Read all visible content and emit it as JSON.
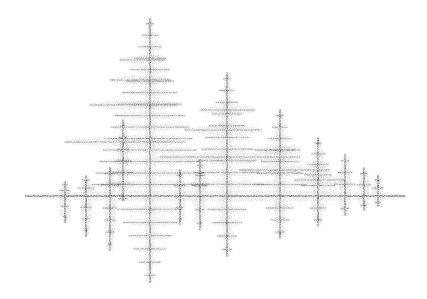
{
  "image": {
    "description": "Grayscale fractal of fir trees mirrored along a horizontal axis (IFS fern-like pattern)",
    "background": "#ffffff",
    "ink": "#2a2a2a"
  },
  "axis": {
    "x1": 25,
    "x2": 405,
    "y": 196
  },
  "trees": [
    {
      "x": 150,
      "top": 18,
      "bottom": 282,
      "halfwidth": 62
    },
    {
      "x": 227,
      "top": 73,
      "bottom": 256,
      "halfwidth": 40
    },
    {
      "x": 280,
      "top": 110,
      "bottom": 238,
      "halfwidth": 30
    },
    {
      "x": 318,
      "top": 138,
      "bottom": 226,
      "halfwidth": 20
    },
    {
      "x": 345,
      "top": 155,
      "bottom": 215,
      "halfwidth": 14
    },
    {
      "x": 364,
      "top": 168,
      "bottom": 210,
      "halfwidth": 10
    },
    {
      "x": 378,
      "top": 176,
      "bottom": 206,
      "halfwidth": 8
    },
    {
      "x": 86,
      "top": 176,
      "bottom": 236,
      "halfwidth": 12
    },
    {
      "x": 110,
      "top": 168,
      "bottom": 250,
      "halfwidth": 14
    },
    {
      "x": 65,
      "top": 182,
      "bottom": 222,
      "halfwidth": 8
    },
    {
      "x": 123,
      "top": 120,
      "bottom": 200,
      "halfwidth": 14
    },
    {
      "x": 200,
      "top": 160,
      "bottom": 230,
      "halfwidth": 10
    },
    {
      "x": 180,
      "top": 170,
      "bottom": 225,
      "halfwidth": 8
    }
  ],
  "branches": [
    {
      "x1": 65,
      "x2": 185,
      "y": 142
    },
    {
      "x1": 90,
      "x2": 178,
      "y": 105
    },
    {
      "x1": 110,
      "x2": 170,
      "y": 80
    },
    {
      "x1": 120,
      "x2": 165,
      "y": 60
    },
    {
      "x1": 160,
      "x2": 300,
      "y": 157
    },
    {
      "x1": 185,
      "x2": 262,
      "y": 130
    },
    {
      "x1": 200,
      "x2": 255,
      "y": 110
    },
    {
      "x1": 240,
      "x2": 330,
      "y": 170
    },
    {
      "x1": 255,
      "x2": 300,
      "y": 150
    },
    {
      "x1": 295,
      "x2": 345,
      "y": 180
    }
  ]
}
